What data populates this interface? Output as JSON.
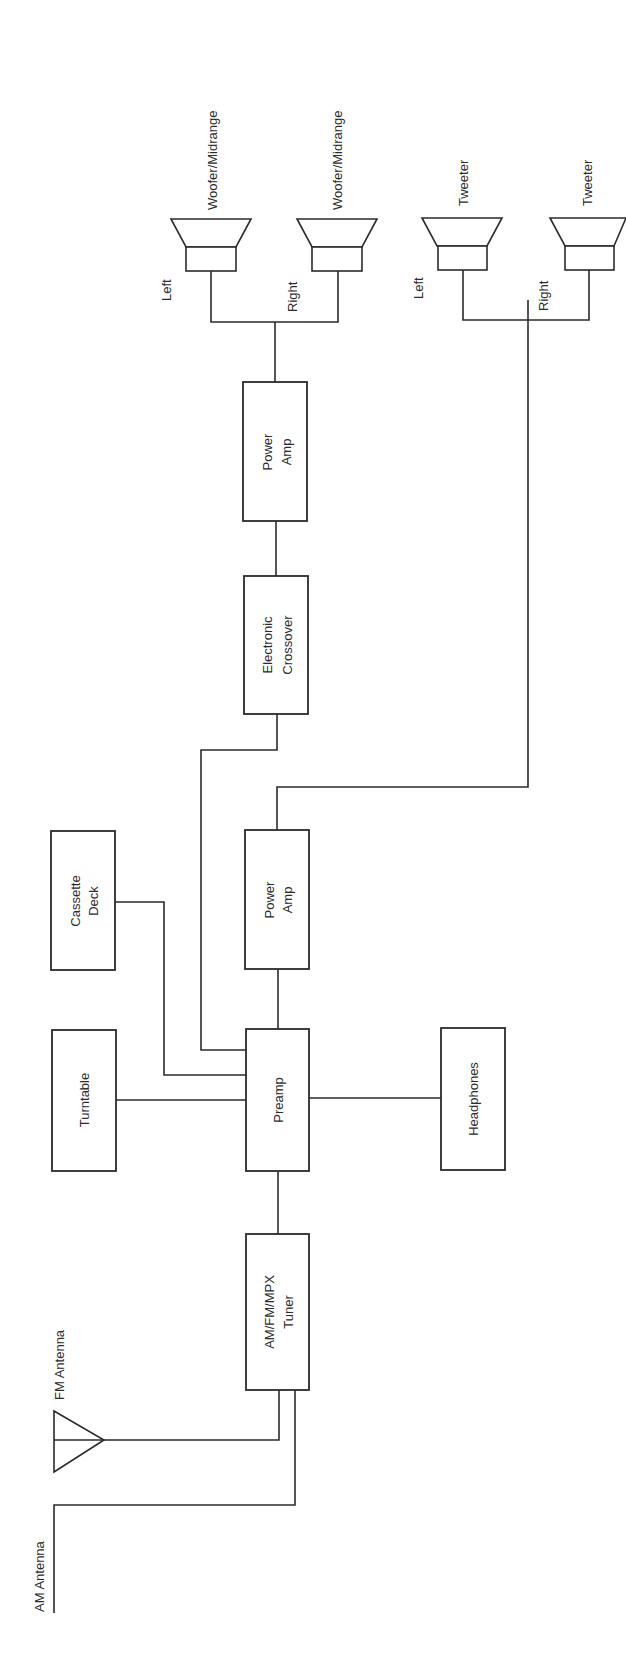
{
  "diagram": {
    "type": "block-diagram",
    "orientation": "rotated 90deg counter-clockwise",
    "line_color": "#2b2b2b",
    "background": "#ffffff",
    "antennas": {
      "am": {
        "label": "AM Antenna"
      },
      "fm": {
        "label": "FM Antenna"
      }
    },
    "blocks": {
      "tuner": {
        "line1": "AM/FM/MPX",
        "line2": "Tuner"
      },
      "preamp": {
        "line1": "Preamp"
      },
      "turntable": {
        "line1": "Turntable"
      },
      "cassette": {
        "line1": "Cassette",
        "line2": "Deck"
      },
      "headphones": {
        "line1": "Headphones"
      },
      "power_amp_tweeter": {
        "line1": "Power",
        "line2": "Amp"
      },
      "crossover": {
        "line1": "Electronic",
        "line2": "Crossover"
      },
      "power_amp_woofer": {
        "line1": "Power",
        "line2": "Amp"
      }
    },
    "speakers": {
      "woofer_left": {
        "label": "Woofer/Midrange",
        "channel": "Left"
      },
      "woofer_right": {
        "label": "Woofer/Midrange",
        "channel": "Right"
      },
      "tweeter_left": {
        "label": "Tweeter",
        "channel": "Left"
      },
      "tweeter_right": {
        "label": "Tweeter",
        "channel": "Right"
      }
    },
    "connections": [
      [
        "AM Antenna",
        "AM/FM/MPX Tuner"
      ],
      [
        "FM Antenna",
        "AM/FM/MPX Tuner"
      ],
      [
        "AM/FM/MPX Tuner",
        "Preamp"
      ],
      [
        "Turntable",
        "Preamp"
      ],
      [
        "Cassette Deck",
        "Preamp"
      ],
      [
        "Preamp",
        "Headphones"
      ],
      [
        "Preamp",
        "Power Amp (tweeter)"
      ],
      [
        "Preamp",
        "Electronic Crossover"
      ],
      [
        "Electronic Crossover",
        "Power Amp (woofer)"
      ],
      [
        "Power Amp (woofer)",
        "Woofer/Midrange Left"
      ],
      [
        "Power Amp (woofer)",
        "Woofer/Midrange Right"
      ],
      [
        "Power Amp (tweeter)",
        "Tweeter Left"
      ],
      [
        "Power Amp (tweeter)",
        "Tweeter Right"
      ]
    ]
  }
}
